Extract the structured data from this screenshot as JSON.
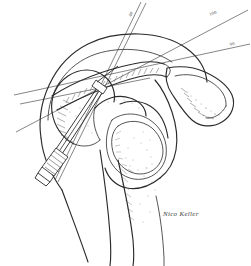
{
  "figure": {
    "background_color": "#ffffff",
    "ink_color": "#2b2b2b",
    "width": 251,
    "height": 266
  },
  "annotations": {
    "guide_labels": [
      {
        "id": "label-a",
        "text": "40",
        "x": 131,
        "y": 17,
        "rotation": -62
      },
      {
        "id": "label-b",
        "text": "100",
        "x": 210,
        "y": 16,
        "rotation": -22
      },
      {
        "id": "label-c",
        "text": "90",
        "x": 230,
        "y": 46,
        "rotation": -11
      }
    ],
    "signature": {
      "text": "Nico Keller",
      "x": 163,
      "y": 216
    }
  },
  "anatomy": {
    "structures": [
      {
        "name": "humeral-head",
        "label": "Humeral head"
      },
      {
        "name": "glenoid-fossa",
        "label": "Glenoid fossa"
      },
      {
        "name": "acromion",
        "label": "Acromion"
      },
      {
        "name": "coracoid-process",
        "label": "Coracoid process"
      },
      {
        "name": "scapular-spine",
        "label": "Scapular spine"
      },
      {
        "name": "humeral-shaft",
        "label": "Humeral shaft"
      },
      {
        "name": "clavicle",
        "label": "Clavicle"
      }
    ]
  },
  "implant": {
    "name": "cannulated-screw",
    "label": "Cannulated screw with guide pin",
    "components": [
      {
        "name": "screw-shaft",
        "label": "Screw shaft"
      },
      {
        "name": "screw-head",
        "label": "Threaded screw head"
      },
      {
        "name": "guide-pin",
        "label": "Guide pin"
      }
    ]
  }
}
